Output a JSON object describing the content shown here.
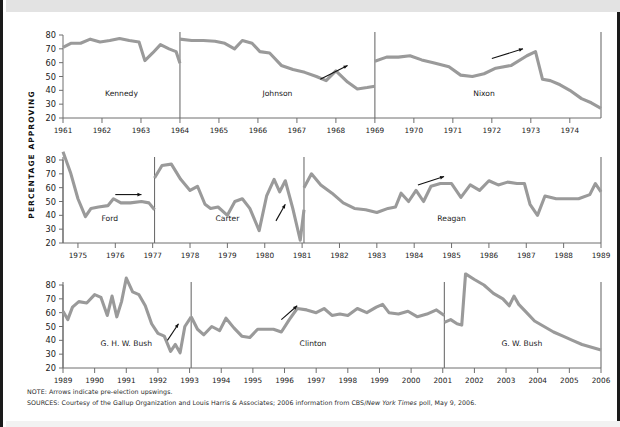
{
  "figure": {
    "y_axis_title": "PERCENTAGE APPROVING",
    "note": "NOTE: Arrows indicate pre-election upswings.",
    "sources_prefix": "SOURCES: Courtesy of the Gallup Organization and Louis Harris & Associates; 2006 information from CBS/",
    "sources_italic": "New York Times",
    "sources_suffix": " poll, May 9, 2006.",
    "line_color": "#9a9a9a",
    "axis_color": "#6e6e6e",
    "arrow_color": "#111111",
    "band_color": "#e3e3e3",
    "border_color": "#1a1a1a"
  },
  "chart_data": {
    "type": "line",
    "xlabel": "",
    "ylabel": "PERCENTAGE APPROVING",
    "ylim": [
      20,
      85
    ],
    "yticks": [
      20,
      30,
      40,
      50,
      60,
      70,
      80
    ],
    "grid": false,
    "legend": "none",
    "annotation_note": "Arrows indicate pre-election upswings.",
    "rows": [
      {
        "row_index": 0,
        "xlim": [
          1961,
          1974.8
        ],
        "xticks": [
          1961,
          1962,
          1963,
          1964,
          1965,
          1966,
          1967,
          1968,
          1969,
          1970,
          1971,
          1972,
          1973,
          1974
        ],
        "dividers": [
          1964.0,
          1969.0,
          1974.8
        ],
        "presidents": [
          {
            "name": "Kennedy",
            "label_x": 1962.5,
            "start": 1961.0,
            "end": 1964.0
          },
          {
            "name": "Johnson",
            "label_x": 1966.5,
            "start": 1964.0,
            "end": 1969.0
          },
          {
            "name": "Nixon",
            "label_x": 1971.8,
            "start": 1969.0,
            "end": 1974.8
          }
        ],
        "arrows": [
          {
            "x1": 1967.6,
            "y1": 48,
            "x2": 1968.3,
            "y2": 58
          },
          {
            "x1": 1972.0,
            "y1": 63,
            "x2": 1972.8,
            "y2": 70
          }
        ],
        "series": [
          {
            "name": "Kennedy",
            "x": [
              1961.0,
              1961.2,
              1961.45,
              1961.7,
              1961.95,
              1962.2,
              1962.45,
              1962.7,
              1962.95,
              1963.1,
              1963.3,
              1963.5,
              1963.72,
              1963.9,
              1964.0
            ],
            "y": [
              71,
              74,
              74,
              77,
              75,
              76,
              77.5,
              76,
              75,
              61.5,
              67,
              73,
              70,
              68,
              59.5
            ]
          },
          {
            "name": "Johnson",
            "x": [
              1964.0,
              1964.3,
              1964.6,
              1964.9,
              1965.15,
              1965.4,
              1965.6,
              1965.85,
              1966.05,
              1966.3,
              1966.6,
              1966.9,
              1967.2,
              1967.5,
              1967.75,
              1968.0,
              1968.3,
              1968.55,
              1968.8,
              1969.0
            ],
            "y": [
              77,
              76,
              76,
              75.5,
              74,
              70,
              76,
              74,
              68,
              67,
              58,
              55,
              53,
              50,
              47,
              54,
              46,
              41,
              42,
              43
            ]
          },
          {
            "name": "Nixon",
            "x": [
              1969.0,
              1969.3,
              1969.6,
              1969.9,
              1970.2,
              1970.5,
              1970.9,
              1971.2,
              1971.5,
              1971.8,
              1972.1,
              1972.5,
              1972.9,
              1973.12,
              1973.3,
              1973.5,
              1973.75,
              1974.0,
              1974.3,
              1974.55,
              1974.8
            ],
            "y": [
              61,
              64,
              64,
              65,
              62,
              60,
              57,
              51,
              50,
              52,
              56,
              58,
              65,
              68,
              48,
              47,
              44,
              40,
              34,
              31,
              27
            ]
          }
        ]
      },
      {
        "row_index": 1,
        "xlim": [
          1974.6,
          1989.0
        ],
        "xticks": [
          1975,
          1976,
          1977,
          1978,
          1979,
          1980,
          1981,
          1982,
          1983,
          1984,
          1985,
          1986,
          1987,
          1988,
          1989
        ],
        "dividers": [
          1974.6,
          1977.05,
          1981.05,
          1989.0
        ],
        "presidents": [
          {
            "name": "Ford",
            "label_x": 1975.85,
            "start": 1974.6,
            "end": 1977.05
          },
          {
            "name": "Carter",
            "label_x": 1979.0,
            "start": 1977.05,
            "end": 1981.05
          },
          {
            "name": "Reagan",
            "label_x": 1985.0,
            "start": 1981.05,
            "end": 1989.0
          }
        ],
        "arrows": [
          {
            "x1": 1976.0,
            "y1": 55,
            "x2": 1976.7,
            "y2": 55
          },
          {
            "x1": 1980.3,
            "y1": 36,
            "x2": 1980.55,
            "y2": 48
          },
          {
            "x1": 1984.1,
            "y1": 62,
            "x2": 1984.8,
            "y2": 68
          }
        ],
        "series": [
          {
            "name": "Ford",
            "x": [
              1974.6,
              1974.8,
              1975.0,
              1975.2,
              1975.35,
              1975.55,
              1975.8,
              1975.95,
              1976.15,
              1976.4,
              1976.7,
              1976.9,
              1977.05
            ],
            "y": [
              86,
              71,
              52,
              39,
              45,
              46,
              47,
              52,
              49,
              49,
              50,
              49,
              44
            ]
          },
          {
            "name": "Carter",
            "x": [
              1977.05,
              1977.25,
              1977.5,
              1977.75,
              1978.0,
              1978.2,
              1978.4,
              1978.55,
              1978.75,
              1979.0,
              1979.2,
              1979.4,
              1979.6,
              1979.85,
              1980.05,
              1980.25,
              1980.4,
              1980.55,
              1980.75,
              1980.95,
              1981.05
            ],
            "y": [
              67,
              76,
              77,
              66,
              58,
              61,
              48,
              45,
              46,
              40,
              50,
              52,
              45,
              29,
              54,
              66,
              57,
              65,
              45,
              22,
              44
            ]
          },
          {
            "name": "Reagan",
            "x": [
              1981.05,
              1981.25,
              1981.5,
              1981.8,
              1982.1,
              1982.4,
              1982.7,
              1983.0,
              1983.3,
              1983.5,
              1983.65,
              1983.85,
              1984.05,
              1984.25,
              1984.45,
              1984.7,
              1985.0,
              1985.25,
              1985.5,
              1985.75,
              1986.0,
              1986.25,
              1986.5,
              1986.75,
              1986.95,
              1987.1,
              1987.3,
              1987.5,
              1987.8,
              1988.1,
              1988.4,
              1988.7,
              1988.85,
              1989.0
            ],
            "y": [
              60,
              70,
              62,
              56,
              49,
              45,
              44,
              42,
              45,
              46,
              56,
              50,
              58,
              50,
              61,
              63,
              63,
              53,
              62,
              58,
              65,
              62,
              64,
              63,
              63,
              48,
              40,
              54,
              52,
              52,
              52,
              55,
              63,
              57
            ]
          }
        ]
      },
      {
        "row_index": 2,
        "xlim": [
          1989.0,
          2006.0
        ],
        "xticks": [
          1989,
          1990,
          1991,
          1992,
          1993,
          1994,
          1995,
          1996,
          1997,
          1998,
          1999,
          2000,
          2001,
          2002,
          2003,
          2004,
          2005,
          2006
        ],
        "dividers": [
          1989.0,
          1993.05,
          2001.05,
          2006.0
        ],
        "presidents": [
          {
            "name": "G. H. W. Bush",
            "label_x": 1991.0,
            "start": 1989.0,
            "end": 1993.05
          },
          {
            "name": "Clinton",
            "label_x": 1996.9,
            "start": 1993.05,
            "end": 2001.05
          },
          {
            "name": "G. W. Bush",
            "label_x": 2003.5,
            "start": 2001.05,
            "end": 2006.0
          }
        ],
        "arrows": [
          {
            "x1": 1992.3,
            "y1": 40,
            "x2": 1992.65,
            "y2": 52
          },
          {
            "x1": 1995.9,
            "y1": 55,
            "x2": 1996.4,
            "y2": 65
          }
        ],
        "series": [
          {
            "name": "G. H. W. Bush",
            "x": [
              1989.0,
              1989.15,
              1989.3,
              1989.5,
              1989.75,
              1990.0,
              1990.2,
              1990.4,
              1990.55,
              1990.7,
              1990.85,
              1991.0,
              1991.2,
              1991.4,
              1991.6,
              1991.8,
              1992.0,
              1992.2,
              1992.4,
              1992.55,
              1992.7,
              1992.85,
              1993.05
            ],
            "y": [
              61,
              55,
              64,
              68,
              67,
              73,
              71,
              58,
              72,
              57,
              68,
              85,
              75,
              73,
              65,
              52,
              45,
              43,
              32,
              37,
              31,
              50,
              57
            ]
          },
          {
            "name": "Clinton",
            "x": [
              1993.05,
              1993.25,
              1993.45,
              1993.7,
              1993.95,
              1994.15,
              1994.4,
              1994.65,
              1994.9,
              1995.15,
              1995.4,
              1995.65,
              1995.9,
              1996.15,
              1996.4,
              1996.7,
              1997.0,
              1997.25,
              1997.5,
              1997.75,
              1998.0,
              1998.3,
              1998.6,
              1998.9,
              1999.1,
              1999.3,
              1999.6,
              1999.9,
              2000.2,
              2000.5,
              2000.8,
              2001.05
            ],
            "y": [
              57,
              48,
              44,
              50,
              47,
              56,
              49,
              43,
              42,
              48,
              48,
              48,
              46,
              55,
              63,
              62,
              60,
              63,
              58,
              59,
              58,
              63,
              60,
              64,
              66,
              60,
              59,
              61,
              57,
              59,
              62,
              58
            ]
          },
          {
            "name": "G. W. Bush",
            "x": [
              2001.05,
              2001.25,
              2001.45,
              2001.6,
              2001.72,
              2002.0,
              2002.3,
              2002.6,
              2002.9,
              2003.1,
              2003.25,
              2003.4,
              2003.65,
              2003.9,
              2004.2,
              2004.5,
              2004.8,
              2005.1,
              2005.4,
              2005.7,
              2006.0
            ],
            "y": [
              53,
              55,
              52,
              51,
              88,
              84,
              80,
              74,
              70,
              65,
              72,
              66,
              60,
              54,
              50,
              46,
              43,
              40,
              37,
              35,
              33
            ]
          }
        ]
      }
    ]
  }
}
